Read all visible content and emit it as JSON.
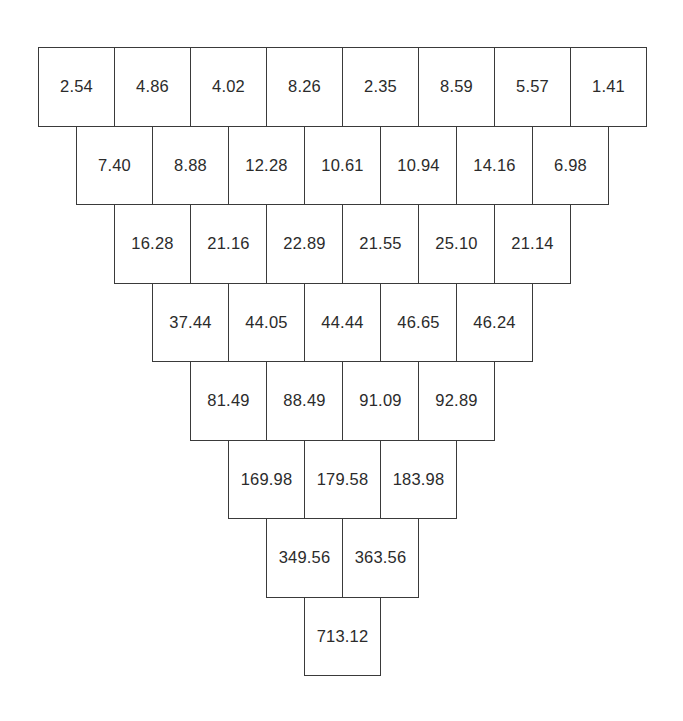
{
  "diagram": {
    "type": "inverted-pyramid-sum",
    "rows": [
      [
        "2.54",
        "4.86",
        "4.02",
        "8.26",
        "2.35",
        "8.59",
        "5.57",
        "1.41"
      ],
      [
        "7.40",
        "8.88",
        "12.28",
        "10.61",
        "10.94",
        "14.16",
        "6.98"
      ],
      [
        "16.28",
        "21.16",
        "22.89",
        "21.55",
        "25.10",
        "21.14"
      ],
      [
        "37.44",
        "44.05",
        "44.44",
        "46.65",
        "46.24"
      ],
      [
        "81.49",
        "88.49",
        "91.09",
        "92.89"
      ],
      [
        "169.98",
        "179.58",
        "183.98"
      ],
      [
        "349.56",
        "363.56"
      ],
      [
        "713.12"
      ]
    ]
  },
  "layout": {
    "left": 38,
    "top": 47,
    "cell_width": 76,
    "cell_height": 78.5,
    "border_color": "#3a3a3a",
    "text_color": "#2b2b2b"
  }
}
